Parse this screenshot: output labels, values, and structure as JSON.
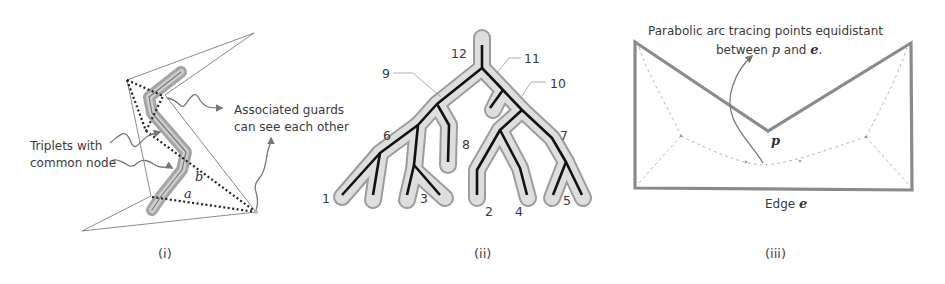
{
  "figure": {
    "panels": [
      {
        "id": "i",
        "caption": "(i)",
        "labels": {
          "triplets_line1": "Triplets with",
          "triplets_line2": "common node",
          "guards_line1": "Associated guards",
          "guards_line2": "can see each other",
          "var_a": "a",
          "var_b": "b"
        }
      },
      {
        "id": "ii",
        "caption": "(ii)",
        "node_labels": [
          "1",
          "2",
          "3",
          "4",
          "5",
          "6",
          "7",
          "8",
          "9",
          "10",
          "11",
          "12"
        ]
      },
      {
        "id": "iii",
        "caption": "(iii)",
        "labels": {
          "title_line1": "Parabolic arc tracing points equidistant",
          "title_line2_pre": "between ",
          "title_line2_p": "p",
          "title_line2_mid": " and ",
          "title_line2_e": "e",
          "title_line2_post": ".",
          "vertex": "p",
          "edge_label_pre": "Edge ",
          "edge_label_var": "e"
        }
      }
    ],
    "colors": {
      "polygon_outline": "#8a8a8a",
      "skeleton": "#111111",
      "halo_fill": "#d9d9d9",
      "halo_stroke": "#9a9a9a",
      "annotation_arrow": "#777777",
      "dashed": "#aaaaaa"
    }
  }
}
